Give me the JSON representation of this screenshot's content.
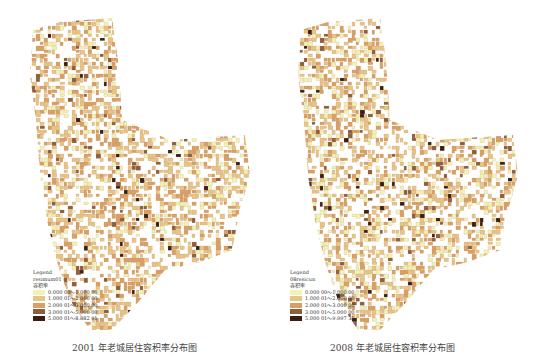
{
  "maps": [
    {
      "legend": {
        "title": "Legend",
        "layer": "resimum01",
        "field": "容积率",
        "classes": [
          {
            "label": "0.000 00～1.000 00",
            "color": "#f3f2b4"
          },
          {
            "label": "1.000 01～2.000 00",
            "color": "#e8c488"
          },
          {
            "label": "2.000 01～3.000 00",
            "color": "#d9a066"
          },
          {
            "label": "3.000 01～5.000 00",
            "color": "#8e5e3e"
          },
          {
            "label": "5.000 01～8.882 91",
            "color": "#3a1e14"
          }
        ]
      },
      "caption": "2001 年老城居住容积率分布图"
    },
    {
      "legend": {
        "title": "Legend",
        "layer": "08resicun",
        "field": "容积率",
        "classes": [
          {
            "label": "0.000 00～1.000 00",
            "color": "#f3f2b4"
          },
          {
            "label": "1.000 01～2.000 00",
            "color": "#e8c488"
          },
          {
            "label": "2.000 01～3.000 00",
            "color": "#d9a066"
          },
          {
            "label": "3.000 01～5.000 00",
            "color": "#8e5e3e"
          },
          {
            "label": "5.000 01～9.997 31",
            "color": "#3a1e14"
          }
        ]
      },
      "caption": "2008 年老城居住容积率分布图"
    }
  ]
}
